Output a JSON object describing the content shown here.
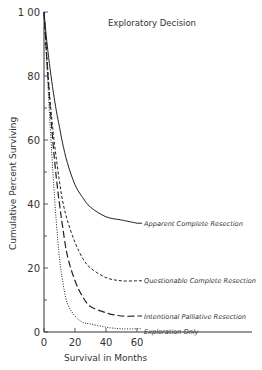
{
  "chart_data": {
    "type": "line",
    "title": "Exploratory Decision",
    "xlabel": "Survival in Months",
    "ylabel": "Cumulative Percent Surviving",
    "xlim": [
      0,
      60
    ],
    "ylim": [
      0,
      100
    ],
    "x_ticks": [
      "0",
      "20",
      "40",
      "60"
    ],
    "y_ticks": [
      "0",
      "20",
      "40",
      "60",
      "80",
      "1 00"
    ],
    "grid": false,
    "legend_position": "inline labels at right end of each curve",
    "x": [
      0,
      2,
      4,
      6,
      8,
      10,
      12,
      15,
      20,
      25,
      30,
      40,
      50,
      60
    ],
    "series": [
      {
        "name": "Apparent Complete Resection",
        "style": "solid",
        "values": [
          100,
          90,
          82,
          75,
          69,
          64,
          59,
          53,
          46,
          42,
          39,
          36,
          35,
          34
        ]
      },
      {
        "name": "Questionable Complete Resection",
        "style": "short-dash",
        "values": [
          100,
          85,
          72,
          62,
          54,
          47,
          41,
          35,
          28,
          23,
          20,
          17,
          16,
          16
        ]
      },
      {
        "name": "Intentional Palliative Resection",
        "style": "long-dash",
        "values": [
          100,
          84,
          70,
          58,
          48,
          40,
          33,
          24,
          16,
          11,
          8,
          6,
          5,
          5
        ]
      },
      {
        "name": "Exploration Only",
        "style": "dotted",
        "values": [
          100,
          82,
          64,
          48,
          34,
          23,
          16,
          9,
          5,
          3,
          2.5,
          1.5,
          1,
          1
        ]
      }
    ]
  }
}
